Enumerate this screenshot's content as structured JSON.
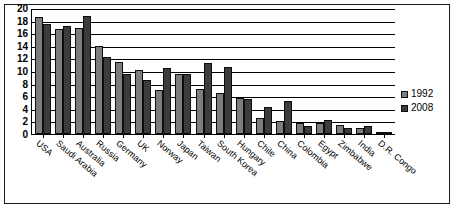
{
  "chart_data": {
    "type": "bar",
    "title": "",
    "subtitle": "",
    "xlabel": "",
    "ylabel": "",
    "ylim": [
      0,
      20
    ],
    "yticks": [
      0,
      2,
      4,
      6,
      8,
      10,
      12,
      14,
      16,
      18,
      20
    ],
    "grid": true,
    "legend_position": "right",
    "categories": [
      "USA",
      "Saudi Arabia",
      "Australia",
      "Russia",
      "Germany",
      "UK",
      "Norway",
      "Japan",
      "Taiwan",
      "South Korea",
      "Hungary",
      "Chile",
      "China",
      "Colombia",
      "Egypt",
      "Zimbabwe",
      "India",
      "D.R. Congo"
    ],
    "series": [
      {
        "name": "1992",
        "color": "#7d7d7d",
        "values": [
          18.6,
          16.7,
          16.8,
          14.0,
          11.4,
          10.2,
          7.0,
          9.5,
          7.1,
          6.5,
          5.7,
          2.5,
          2.1,
          1.7,
          1.7,
          1.5,
          0.9,
          0.15
        ]
      },
      {
        "name": "2008",
        "color": "#3c3c3c",
        "values": [
          17.5,
          17.2,
          18.8,
          12.2,
          9.5,
          8.5,
          10.4,
          9.5,
          11.2,
          10.6,
          5.5,
          4.3,
          5.3,
          1.3,
          2.3,
          0.9,
          1.3,
          0.05
        ]
      }
    ]
  },
  "legend": {
    "entries": [
      {
        "label": "1992"
      },
      {
        "label": "2008"
      }
    ]
  }
}
